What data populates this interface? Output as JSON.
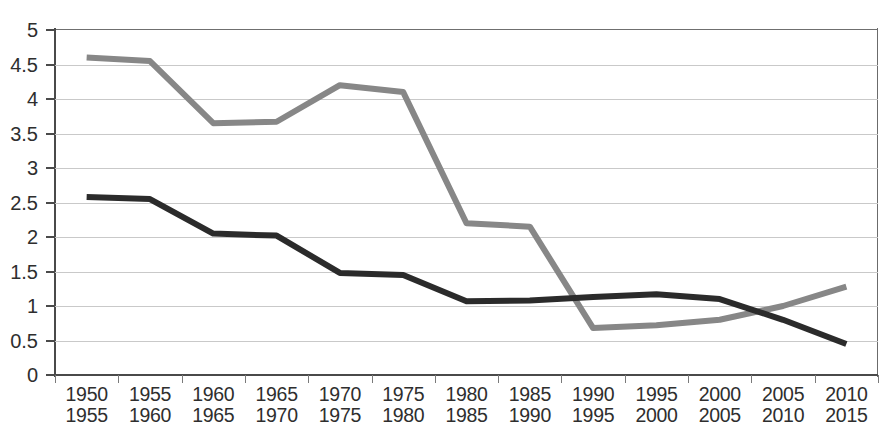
{
  "chart_data": {
    "type": "line",
    "title": "",
    "subtitle": "",
    "xlabel": "",
    "ylabel": "",
    "ylim": [
      0,
      5
    ],
    "y_ticks": [
      "0",
      "0.5",
      "1",
      "1.5",
      "2",
      "2.5",
      "3",
      "3.5",
      "4",
      "4.5",
      "5"
    ],
    "y_tick_values": [
      0,
      0.5,
      1,
      1.5,
      2,
      2.5,
      3,
      3.5,
      4,
      4.5,
      5
    ],
    "grid": true,
    "legend": "none",
    "categories": [
      "1950 1955",
      "1955 1960",
      "1960 1965",
      "1965 1970",
      "1970 1975",
      "1975 1980",
      "1980 1985",
      "1985 1990",
      "1990 1995",
      "1995 2000",
      "2000 2005",
      "2005 2010",
      "2010 2015"
    ],
    "categories_lines": [
      [
        "1950",
        "1955"
      ],
      [
        "1955",
        "1960"
      ],
      [
        "1960",
        "1965"
      ],
      [
        "1965",
        "1970"
      ],
      [
        "1970",
        "1975"
      ],
      [
        "1975",
        "1980"
      ],
      [
        "1980",
        "1985"
      ],
      [
        "1985",
        "1990"
      ],
      [
        "1990",
        "1995"
      ],
      [
        "1995",
        "2000"
      ],
      [
        "2000",
        "2005"
      ],
      [
        "2005",
        "2010"
      ],
      [
        "2010",
        "2015"
      ]
    ],
    "series": [
      {
        "name": "gray-series",
        "color": "#878787",
        "values": [
          4.6,
          4.55,
          3.65,
          3.67,
          4.2,
          4.1,
          2.2,
          2.15,
          0.68,
          0.72,
          0.8,
          1.0,
          1.28
        ]
      },
      {
        "name": "dark-series",
        "color": "#2b2b2b",
        "values": [
          2.58,
          2.55,
          2.05,
          2.02,
          1.48,
          1.45,
          1.07,
          1.08,
          1.13,
          1.17,
          1.1,
          0.8,
          0.45
        ]
      }
    ]
  },
  "style": {
    "gridline_color": "#c9c9c9",
    "axis_color": "#4a4a4a",
    "text_color": "#2e2e2e",
    "background": "#ffffff"
  }
}
